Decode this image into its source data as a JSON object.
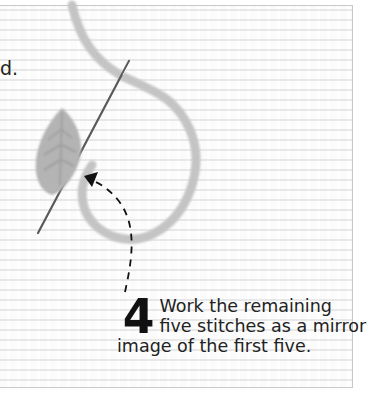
{
  "page": {
    "left_text_fragment": "d.",
    "colors": {
      "yarn": "#c4c4c4",
      "leaf": "#b8b8b8",
      "needle": "#555555",
      "arrow": "#111111",
      "text": "#222222",
      "border": "#c8c8c8"
    }
  },
  "step": {
    "number": "4",
    "lines": [
      "Work the remaining",
      "five stitches as a mirror",
      "image of the first five."
    ]
  },
  "illustration": {
    "elements": [
      "fabric-grid",
      "yarn-loop",
      "needle",
      "leaf-stitch",
      "dashed-arrow"
    ]
  }
}
